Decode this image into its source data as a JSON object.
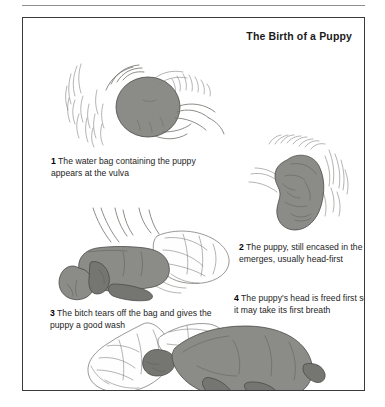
{
  "plate": {
    "title": "The Birth of a Puppy",
    "frame_color": "#3a3a3a",
    "background": "#ffffff"
  },
  "palette": {
    "flesh_gray": "#8b8b87",
    "puppy_gray": "#757572",
    "outline": "#6e6e6a",
    "bag_white": "#fefefe",
    "text": "#1d1d1d"
  },
  "figures": [
    {
      "id": "fig-1",
      "name": "water-bag-at-vulva",
      "description": "Rear view of bitch with rounded dark water bag protruding at the vulva, surrounded by fur strokes"
    },
    {
      "id": "fig-2",
      "name": "puppy-in-bag-emerging",
      "description": "Vertical kidney-shaped bagged puppy emerging head-first below the tail"
    },
    {
      "id": "fig-3",
      "name": "bitch-tearing-bag",
      "description": "Puppy lying on its side with the torn white membrane bag spread behind it"
    },
    {
      "id": "fig-4",
      "name": "puppy-head-freed",
      "description": "Puppy with head freed from the bag, white membrane draped to the left"
    }
  ],
  "captions": [
    {
      "number": "1",
      "text": "The  water bag containing the puppy appears at the vulva"
    },
    {
      "number": "2",
      "text": "The puppy, still encased in the bag, emerges, usually head-first"
    },
    {
      "number": "3",
      "text": "The bitch tears off the bag and gives the puppy a good wash"
    },
    {
      "number": "4",
      "text": "The puppy's head is freed first so that it may take its first breath"
    }
  ]
}
